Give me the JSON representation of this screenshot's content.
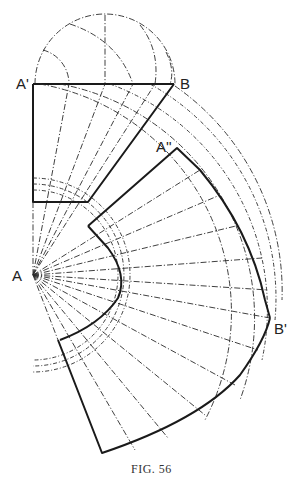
{
  "figure": {
    "caption": "FIG. 56",
    "labels": {
      "a_prime": "A'",
      "b": "B",
      "a": "A",
      "a_double_prime": "A''",
      "b_prime": "B'"
    },
    "colors": {
      "ink": "#1a1a1a",
      "paper": "#ffffff"
    },
    "points": {
      "A": [
        33,
        275
      ],
      "A_prime": [
        33,
        84
      ],
      "B": [
        174,
        84
      ],
      "A_double_prime": [
        177,
        148
      ],
      "B_prime": [
        270,
        318
      ],
      "rect_bottom_left": [
        33,
        202
      ],
      "rect_bottom_right": [
        88,
        202
      ],
      "lower_sector_top": [
        58,
        340
      ],
      "lower_sector_bottom": [
        102,
        453
      ]
    }
  }
}
